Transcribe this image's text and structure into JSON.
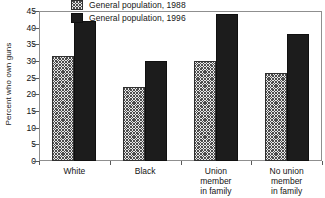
{
  "chart_data": {
    "type": "bar",
    "title": "",
    "xlabel": "",
    "ylabel": "Percent who own guns",
    "ylim": [
      0,
      45
    ],
    "yticks": [
      0,
      5,
      10,
      15,
      20,
      25,
      30,
      35,
      40,
      45
    ],
    "grid": false,
    "legend_position": "top-center-inside",
    "categories": [
      "White",
      "Black",
      "Union\nmember\nin family",
      "No union\nmember\nin family"
    ],
    "series": [
      {
        "name": "General population, 1988",
        "values": [
          31.5,
          22.2,
          30.0,
          26.5
        ],
        "fill": "hatched",
        "color": "#e8e8e8"
      },
      {
        "name": "General population, 1996",
        "values": [
          42.0,
          30.1,
          44.0,
          38.0
        ],
        "fill": "solid",
        "color": "#1c1c1c"
      }
    ]
  },
  "axis": {
    "y_title": "Percent who own guns",
    "y_tick_labels": [
      "0",
      "5",
      "10",
      "15",
      "20",
      "25",
      "30",
      "35",
      "40",
      "45"
    ]
  },
  "legend": {
    "items": [
      {
        "label": "General population, 1988"
      },
      {
        "label": "General population, 1996"
      }
    ]
  },
  "colors": {
    "series_1988": "#e8e8e8",
    "series_1996": "#1c1c1c",
    "axis": "#8f8f8f",
    "text": "#141414",
    "background": "#ffffff"
  }
}
